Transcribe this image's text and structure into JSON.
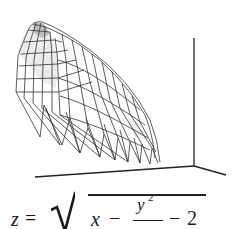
{
  "figure": {
    "type": "3d-wireframe-surface",
    "colors": {
      "mesh": "#333333",
      "shade": "#e6e6e6",
      "shade_dark": "#b5b5b5",
      "axes": "#222222",
      "background": "#ffffff"
    }
  },
  "formula": {
    "lhs": "z",
    "equals": "=",
    "radicand": {
      "x": "x",
      "minus1": "−",
      "frac_num": "y",
      "frac_num_exp": "2",
      "minus2": "−",
      "constant": "2"
    },
    "text": "z = √(x − y²/… − 2)"
  }
}
